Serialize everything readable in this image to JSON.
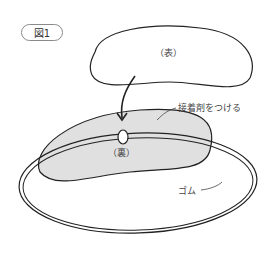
{
  "figure": {
    "badge": "図1",
    "labels": {
      "front": "（表）",
      "back": "（裏）",
      "glue": "接着剤をつける",
      "elastic": "ゴム"
    },
    "colors": {
      "outline": "#222222",
      "fill_front": "#ffffff",
      "fill_back": "#e0e0e0",
      "badge_border": "#8a8a8a"
    }
  }
}
